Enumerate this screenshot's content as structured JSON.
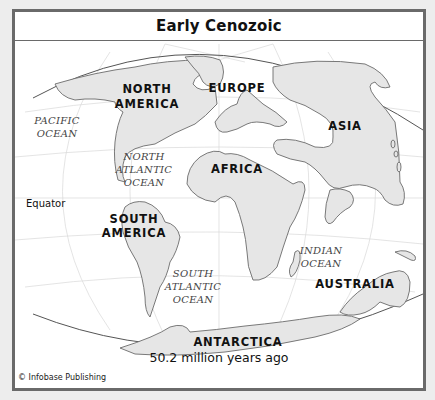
{
  "map": {
    "title": "Early Cenozoic",
    "caption": "50.2 million years ago",
    "credit": "© Infobase Publishing",
    "colors": {
      "frame": "#6a6a6a",
      "land_fill": "#e6e6e6",
      "land_outline": "#6b6b6b",
      "ocean": "#ffffff",
      "grid": "#d8d8d8",
      "background": "#ededed"
    },
    "continents": [
      {
        "id": "north-america",
        "line1": "NORTH",
        "line2": "AMERICA"
      },
      {
        "id": "europe",
        "line1": "EUROPE"
      },
      {
        "id": "asia",
        "line1": "ASIA"
      },
      {
        "id": "africa",
        "line1": "AFRICA"
      },
      {
        "id": "south-america",
        "line1": "SOUTH",
        "line2": "AMERICA"
      },
      {
        "id": "australia",
        "line1": "AUSTRALIA"
      },
      {
        "id": "antarctica",
        "line1": "ANTARCTICA"
      }
    ],
    "oceans": [
      {
        "id": "pacific",
        "line1": "PACIFIC",
        "line2": "OCEAN"
      },
      {
        "id": "north-atlantic",
        "line1": "NORTH",
        "line2": "ATLANTIC",
        "line3": "OCEAN"
      },
      {
        "id": "south-atlantic",
        "line1": "SOUTH",
        "line2": "ATLANTIC",
        "line3": "OCEAN"
      },
      {
        "id": "indian",
        "line1": "INDIAN",
        "line2": "OCEAN"
      }
    ],
    "equator_label": "Equator"
  }
}
